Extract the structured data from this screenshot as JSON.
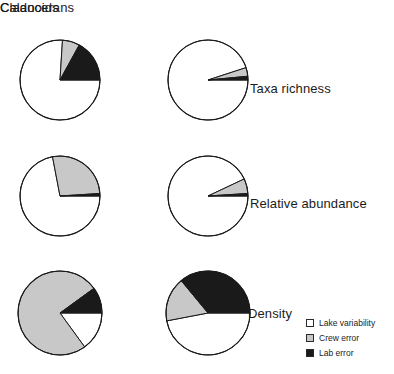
{
  "figure": {
    "columns": [
      {
        "label": "Cladocerans"
      },
      {
        "label": "Calanoids"
      }
    ],
    "rows": [
      {
        "label": "Taxa richness"
      },
      {
        "label": "Relative abundance"
      },
      {
        "label": "Density"
      }
    ]
  },
  "legend": {
    "items": [
      {
        "label": "Lake variability",
        "color": "#ffffff"
      },
      {
        "label": "Crew error",
        "color": "#c8c8c8"
      },
      {
        "label": "Lab error",
        "color": "#1a1a1a"
      }
    ]
  },
  "colors": {
    "lake_variability": "#ffffff",
    "crew_error": "#c8c8c8",
    "lab_error": "#1a1a1a",
    "outline": "#1a1a1a",
    "text": "#1c1c1c",
    "background": "#ffffff"
  },
  "chart_data": {
    "type": "pie",
    "title": "",
    "legend_position": "bottom-right",
    "categories": [
      "Lake variability",
      "Crew error",
      "Lab error"
    ],
    "category_colors": [
      "#ffffff",
      "#c8c8c8",
      "#1a1a1a"
    ],
    "units": "percent of total variance",
    "slice_order_clockwise_from_3oclock": [
      "Lake variability",
      "Crew error",
      "Lab error"
    ],
    "note": "Each pie starts at the 3 o'clock position; Lake variability runs counter-clockwise, Crew error and Lab error occupy the upper-right sector.",
    "panels": [
      {
        "row": "Taxa richness",
        "column": "Cladocerans",
        "values": [
          76,
          7,
          17
        ],
        "angles_deg": [
          273.6,
          25.2,
          61.2
        ],
        "center": [
          60,
          80
        ],
        "radius": 40
      },
      {
        "row": "Taxa richness",
        "column": "Calanoids",
        "values": [
          95,
          3.5,
          1.5
        ],
        "angles_deg": [
          342,
          12.6,
          5.4
        ],
        "center": [
          208,
          80
        ],
        "radius": 40
      },
      {
        "row": "Relative abundance",
        "column": "Cladocerans",
        "values": [
          72,
          27,
          1
        ],
        "angles_deg": [
          259.2,
          97.2,
          3.6
        ],
        "center": [
          60,
          196
        ],
        "radius": 40
      },
      {
        "row": "Relative abundance",
        "column": "Calanoids",
        "values": [
          93,
          6,
          1
        ],
        "angles_deg": [
          334.8,
          21.6,
          3.6
        ],
        "center": [
          208,
          196
        ],
        "radius": 40
      },
      {
        "row": "Density",
        "column": "Cladocerans",
        "values": [
          15,
          75,
          10
        ],
        "angles_deg": [
          54,
          270,
          36
        ],
        "center": [
          60,
          313
        ],
        "radius": 42
      },
      {
        "row": "Density",
        "column": "Calanoids",
        "values": [
          47,
          17,
          36
        ],
        "angles_deg": [
          169.2,
          61.2,
          129.6
        ],
        "center": [
          208,
          313
        ],
        "radius": 42
      }
    ]
  }
}
